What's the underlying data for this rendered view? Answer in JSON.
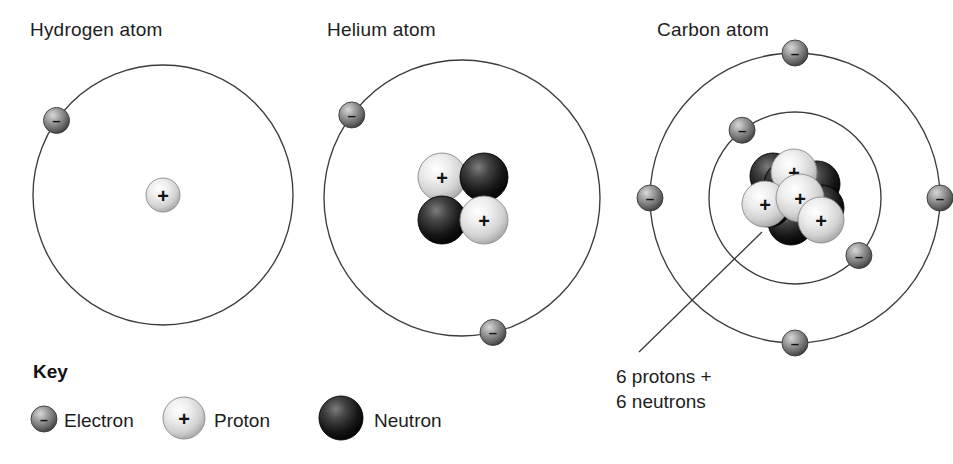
{
  "figure": {
    "background_color": "#ffffff",
    "line_color": "#3c3c3c",
    "text_color": "#1d1d1d"
  },
  "atoms": [
    {
      "id": "hydrogen",
      "title": "Hydrogen atom",
      "title_x": 30,
      "title_y": 36,
      "center": {
        "x": 163,
        "y": 195
      },
      "shells": [
        {
          "radius": 130,
          "electrons": [
            {
              "angle_deg": 145
            }
          ]
        }
      ],
      "nucleus": {
        "particles": [
          {
            "type": "proton",
            "dx": 0,
            "dy": 0,
            "r": 17,
            "sign": "+"
          }
        ]
      }
    },
    {
      "id": "helium",
      "title": "Helium atom",
      "title_x": 327,
      "title_y": 36,
      "center": {
        "x": 462,
        "y": 198
      },
      "shells": [
        {
          "radius": 138,
          "electrons": [
            {
              "angle_deg": 143
            },
            {
              "angle_deg": 283
            }
          ]
        }
      ],
      "nucleus": {
        "particles": [
          {
            "type": "proton",
            "dx": -20,
            "dy": -21,
            "r": 24,
            "sign": "+"
          },
          {
            "type": "neutron",
            "dx": 22,
            "dy": -21,
            "r": 24,
            "sign": ""
          },
          {
            "type": "neutron",
            "dx": -20,
            "dy": 22,
            "r": 24,
            "sign": ""
          },
          {
            "type": "proton",
            "dx": 22,
            "dy": 22,
            "r": 24,
            "sign": "+"
          }
        ]
      }
    },
    {
      "id": "carbon",
      "title": "Carbon atom",
      "title_x": 657,
      "title_y": 36,
      "center": {
        "x": 795,
        "y": 198
      },
      "shells": [
        {
          "radius": 145,
          "electrons": [
            {
              "angle_deg": 90
            },
            {
              "angle_deg": 180
            },
            {
              "angle_deg": 0
            },
            {
              "angle_deg": 270
            }
          ]
        },
        {
          "radius": 86,
          "electrons": [
            {
              "angle_deg": 128
            },
            {
              "angle_deg": 318
            }
          ]
        }
      ],
      "nucleus": {
        "particles": [
          {
            "type": "neutron",
            "dx": -22,
            "dy": -22,
            "r": 23,
            "sign": ""
          },
          {
            "type": "neutron",
            "dx": 22,
            "dy": -14,
            "r": 23,
            "sign": ""
          },
          {
            "type": "neutron",
            "dx": -8,
            "dy": -14,
            "r": 23,
            "sign": ""
          },
          {
            "type": "neutron",
            "dx": -4,
            "dy": 24,
            "r": 23,
            "sign": ""
          },
          {
            "type": "neutron",
            "dx": 26,
            "dy": 10,
            "r": 23,
            "sign": ""
          },
          {
            "type": "neutron",
            "dx": -26,
            "dy": 6,
            "r": 23,
            "sign": ""
          },
          {
            "type": "proton",
            "dx": -1,
            "dy": -26,
            "r": 23,
            "sign": "+"
          },
          {
            "type": "proton",
            "dx": -30,
            "dy": 6,
            "r": 23,
            "sign": "+"
          },
          {
            "type": "proton",
            "dx": 5,
            "dy": 0,
            "r": 24,
            "sign": "+"
          },
          {
            "type": "proton",
            "dx": 26,
            "dy": 22,
            "r": 23,
            "sign": "+"
          }
        ]
      },
      "callout": {
        "line": {
          "x1": 762,
          "y1": 232,
          "x2": 639,
          "y2": 352
        },
        "lines": [
          "6 protons +",
          "6 neutrons"
        ],
        "text_x": 616,
        "text_y": 383,
        "line_height": 25
      }
    }
  ],
  "key": {
    "title": "Key",
    "title_x": 33,
    "title_y": 378,
    "items": [
      {
        "id": "electron",
        "label": "Electron",
        "icon": "electron-sphere-icon",
        "sign": "–",
        "cx": 44,
        "cy": 419,
        "r": 13,
        "label_x": 64,
        "label_y": 427
      },
      {
        "id": "proton",
        "label": "Proton",
        "icon": "proton-sphere-icon",
        "sign": "+",
        "cx": 184,
        "cy": 418,
        "r": 21,
        "label_x": 214,
        "label_y": 427
      },
      {
        "id": "neutron",
        "label": "Neutron",
        "icon": "neutron-sphere-icon",
        "sign": "",
        "cx": 341,
        "cy": 418,
        "r": 22,
        "label_x": 374,
        "label_y": 427
      }
    ]
  },
  "particle_styles": {
    "proton": {
      "light": "#f2f2f2",
      "mid": "#d6d6d6",
      "dark": "#9a9a9a",
      "stroke": "#8a8a8a"
    },
    "neutron": {
      "light": "#6e6e6e",
      "mid": "#2a2a2a",
      "dark": "#080808",
      "stroke": "#000000"
    },
    "electron": {
      "light": "#c9c9c9",
      "mid": "#8d8d8d",
      "dark": "#4a4a4a",
      "stroke": "#3a3a3a"
    }
  }
}
